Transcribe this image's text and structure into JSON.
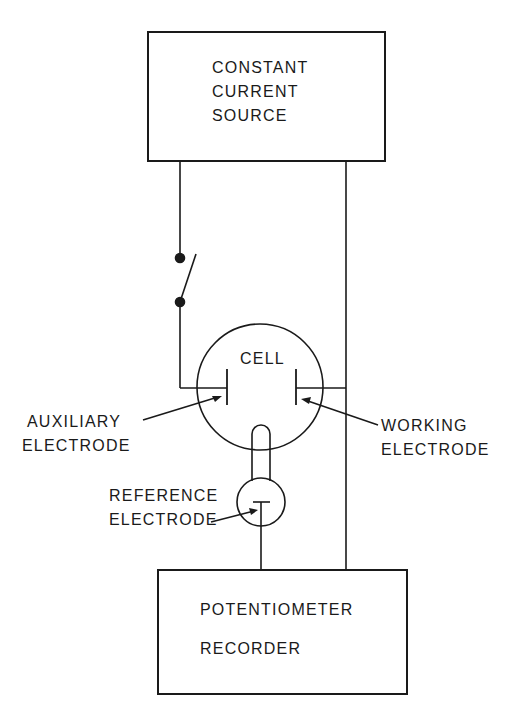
{
  "diagram": {
    "type": "circuit-schematic",
    "stroke_color": "#1a1a1a",
    "background": "#ffffff",
    "nodes": {
      "source": {
        "lines": [
          "CONSTANT",
          "CURRENT",
          "SOURCE"
        ]
      },
      "cell": {
        "label": "CELL"
      },
      "auxiliary_electrode": {
        "lines": [
          "AUXILIARY",
          "ELECTRODE"
        ]
      },
      "working_electrode": {
        "lines": [
          "WORKING",
          "ELECTRODE"
        ]
      },
      "reference_electrode": {
        "lines": [
          "REFERENCE",
          "ELECTRODE"
        ]
      },
      "recorder": {
        "lines": [
          "POTENTIOMETER",
          "RECORDER"
        ]
      }
    },
    "components": [
      "switch",
      "salt-bridge"
    ],
    "connections": [
      {
        "from": "source",
        "to": "auxiliary_electrode",
        "via": "switch"
      },
      {
        "from": "source",
        "to": "working_electrode"
      },
      {
        "from": "working_electrode",
        "to": "recorder"
      },
      {
        "from": "reference_electrode",
        "to": "recorder"
      },
      {
        "from": "cell",
        "to": "reference_electrode",
        "via": "salt-bridge"
      }
    ]
  }
}
